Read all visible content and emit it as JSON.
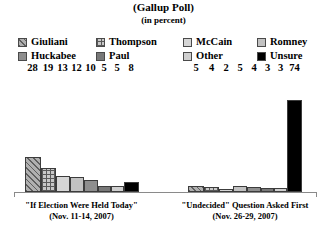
{
  "title": {
    "main": "(Gallup Poll)",
    "sub": "(in percent)"
  },
  "legend": {
    "row1": [
      {
        "label": "Giuliani",
        "key": "giuliani",
        "swatch": "diagonal-hatch",
        "color": "#b0b0b0"
      },
      {
        "label": "Thompson",
        "key": "thompson",
        "swatch": "grid-hatch",
        "color": "#c8c8c8"
      },
      {
        "label": "McCain",
        "key": "mccain",
        "swatch": "solid",
        "color": "#d6d6d6"
      },
      {
        "label": "Romney",
        "key": "romney",
        "swatch": "solid",
        "color": "#c2c2c2"
      }
    ],
    "row2": [
      {
        "label": "Huckabee",
        "key": "huckabee",
        "swatch": "solid",
        "color": "#8e8e8e"
      },
      {
        "label": "Paul",
        "key": "paul",
        "swatch": "solid",
        "color": "#787878"
      },
      {
        "label": "Other",
        "key": "other",
        "swatch": "solid",
        "color": "#cfcfcf"
      },
      {
        "label": "Unsure",
        "key": "unsure",
        "swatch": "solid",
        "color": "#000000"
      }
    ]
  },
  "chart_data": {
    "type": "bar",
    "title": "(Gallup Poll)",
    "subtitle": "(in percent)",
    "xlabel": "",
    "ylabel": "",
    "ylim": [
      0,
      80
    ],
    "grid": false,
    "legend_position": "top",
    "categories": [
      "Giuliani",
      "Thompson",
      "McCain",
      "Romney",
      "Huckabee",
      "Paul",
      "Other",
      "Unsure"
    ],
    "groups": [
      {
        "name": "\"If Election Were Held Today\"",
        "date": "(Nov. 11-14, 2007)",
        "values": [
          28,
          19,
          13,
          12,
          10,
          5,
          5,
          8
        ]
      },
      {
        "name": "\"Undecided\" Question Asked First",
        "date": "(Nov. 26-29, 2007)",
        "values": [
          5,
          4,
          2,
          5,
          4,
          3,
          3,
          74
        ]
      }
    ]
  }
}
